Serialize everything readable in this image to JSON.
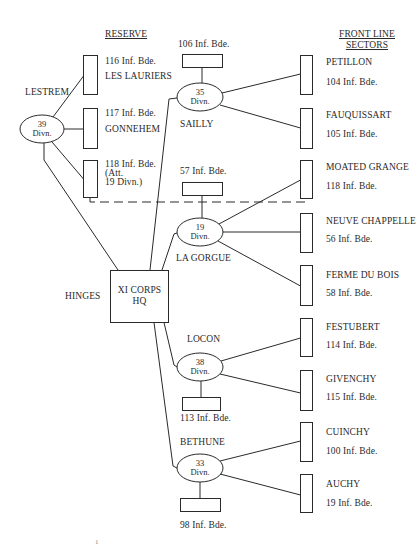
{
  "headers": {
    "reserve": "RESERVE",
    "front_line_1": "FRONT LINE",
    "front_line_2": "SECTORS"
  },
  "corps": {
    "line1": "XI CORPS",
    "line2": "HQ",
    "location": "HINGES"
  },
  "reserve": {
    "division": {
      "number": "39",
      "abbr": "Divn.",
      "location": "LESTREM"
    },
    "brigades": [
      {
        "label": "116 Inf. Bde.",
        "location": "LES LAURIERS"
      },
      {
        "label": "117 Inf. Bde.",
        "location": "GONNEHEM"
      },
      {
        "label": "118 Inf. Bde.",
        "note1": "(Att.",
        "note2": "19 Divn.)"
      }
    ]
  },
  "divisions": [
    {
      "number": "35",
      "abbr": "Divn.",
      "location": "SAILLY",
      "reserve_brigade": "106 Inf. Bde."
    },
    {
      "number": "19",
      "abbr": "Divn.",
      "location": "LA GORGUE",
      "reserve_brigade": "57 Inf. Bde."
    },
    {
      "number": "38",
      "abbr": "Divn.",
      "location": "LOCON",
      "reserve_brigade": "113 Inf. Bde."
    },
    {
      "number": "33",
      "abbr": "Divn.",
      "location": "BETHUNE",
      "reserve_brigade": "98 Inf. Bde."
    }
  ],
  "sectors": [
    {
      "name": "PETILLON",
      "brigade": "104 Inf. Bde."
    },
    {
      "name": "FAUQUISSART",
      "brigade": "105 Inf. Bde."
    },
    {
      "name": "MOATED GRANGE",
      "brigade": "118 Inf. Bde."
    },
    {
      "name": "NEUVE CHAPPELLE",
      "brigade": "56 Inf. Bde."
    },
    {
      "name": "FERME DU BOIS",
      "brigade": "58 Inf. Bde."
    },
    {
      "name": "FESTUBERT",
      "brigade": "114 Inf. Bde."
    },
    {
      "name": "GIVENCHY",
      "brigade": "115 Inf. Bde."
    },
    {
      "name": "CUINCHY",
      "brigade": "100 Inf. Bde."
    },
    {
      "name": "AUCHY",
      "brigade": "19 Inf. Bde."
    }
  ],
  "page_number": "1",
  "colors": {
    "ink": "#2a2a2a",
    "background": "#ffffff"
  }
}
